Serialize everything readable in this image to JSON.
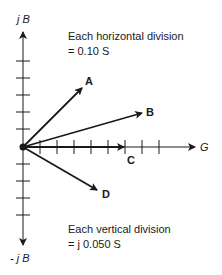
{
  "diagram": {
    "type": "admittance-phasor-diagram",
    "axes": {
      "vertical_positive_label": "j B",
      "vertical_negative_label": "- j B",
      "horizontal_label": "G"
    },
    "notes": {
      "horizontal_line1": "Each horizontal division",
      "horizontal_line2": "= 0.10 S",
      "vertical_line1": "Each vertical division",
      "vertical_line2": "= j 0.050 S"
    },
    "vectors": [
      {
        "label": "A",
        "g_div": 3.5,
        "b_div": 3.5
      },
      {
        "label": "B",
        "g_div": 7.0,
        "b_div": 2.0
      },
      {
        "label": "C",
        "g_div": 6.0,
        "b_div": 0
      },
      {
        "label": "D",
        "g_div": 4.4,
        "b_div": -2.5
      }
    ],
    "ticks": {
      "horizontal_count": 8,
      "vertical_up_count": 5,
      "vertical_down_count": 4
    },
    "colors": {
      "ink": "#1a1a1a",
      "background": "#ffffff"
    }
  }
}
